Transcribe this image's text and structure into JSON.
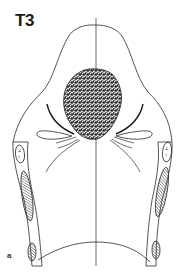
{
  "figure": {
    "title": "T3",
    "panel_label": "a",
    "colors": {
      "line": "#2a2a2a",
      "tumor_fill": "#5a5a5a",
      "background": "#ffffff"
    },
    "elements": [
      "outline-of-larynx",
      "midline",
      "tumor-mass",
      "vocal-fold-curves-left",
      "vocal-fold-curves-right",
      "arytenoid-left",
      "arytenoid-right",
      "cartilage-hatched-left",
      "cartilage-hatched-right"
    ]
  }
}
